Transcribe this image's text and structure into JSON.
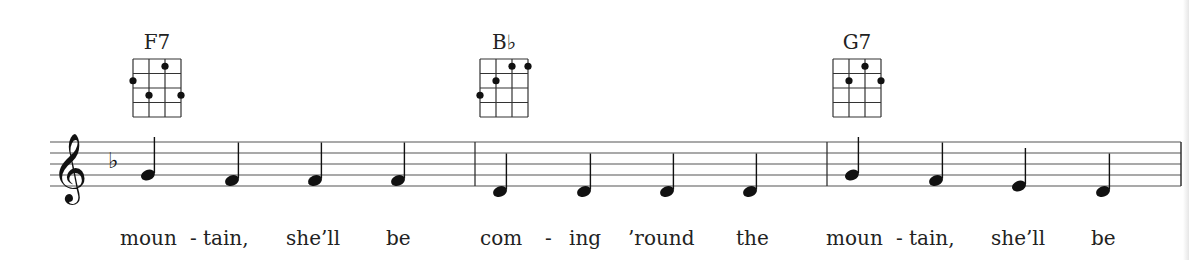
{
  "score": {
    "clef": "treble",
    "key_signature": "F major (one flat: B♭)",
    "staff": {
      "left": 50,
      "right": 1181,
      "top": 142,
      "spacing": 11,
      "lines": 5,
      "color": "#555555"
    },
    "barlines": [
      475,
      827,
      1181
    ],
    "chords": [
      {
        "name": "F7",
        "x": 133,
        "dots": [
          [
            3,
            1
          ],
          [
            1,
            2
          ],
          [
            2,
            3
          ],
          [
            4,
            3
          ]
        ]
      },
      {
        "name": "B♭",
        "x": 480,
        "dots": [
          [
            3,
            1
          ],
          [
            4,
            1
          ],
          [
            2,
            2
          ],
          [
            1,
            3
          ]
        ]
      },
      {
        "name": "G7",
        "x": 833,
        "dots": [
          [
            3,
            1
          ],
          [
            2,
            2
          ],
          [
            4,
            2
          ]
        ]
      }
    ],
    "measures": [
      {
        "notes": [
          {
            "pitch": "G4",
            "x": 148
          },
          {
            "pitch": "F4",
            "x": 232
          },
          {
            "pitch": "F4",
            "x": 315
          },
          {
            "pitch": "F4",
            "x": 398
          }
        ]
      },
      {
        "notes": [
          {
            "pitch": "D4",
            "x": 500
          },
          {
            "pitch": "D4",
            "x": 584
          },
          {
            "pitch": "D4",
            "x": 667
          },
          {
            "pitch": "D4",
            "x": 750
          }
        ]
      },
      {
        "notes": [
          {
            "pitch": "G4",
            "x": 852
          },
          {
            "pitch": "F4",
            "x": 936
          },
          {
            "pitch": "E4",
            "x": 1019
          },
          {
            "pitch": "D4",
            "x": 1103
          }
        ]
      }
    ],
    "lyrics": [
      {
        "text": "moun",
        "x": 120
      },
      {
        "text": "-",
        "x": 190
      },
      {
        "text": "tain,",
        "x": 203
      },
      {
        "text": "she’ll",
        "x": 286
      },
      {
        "text": "be",
        "x": 386
      },
      {
        "text": "com",
        "x": 480
      },
      {
        "text": "-",
        "x": 545
      },
      {
        "text": "ing",
        "x": 569
      },
      {
        "text": "’round",
        "x": 628
      },
      {
        "text": "the",
        "x": 736
      },
      {
        "text": "moun",
        "x": 826
      },
      {
        "text": "-",
        "x": 896
      },
      {
        "text": "tain,",
        "x": 909
      },
      {
        "text": "she’ll",
        "x": 991
      },
      {
        "text": "be",
        "x": 1091
      }
    ]
  }
}
